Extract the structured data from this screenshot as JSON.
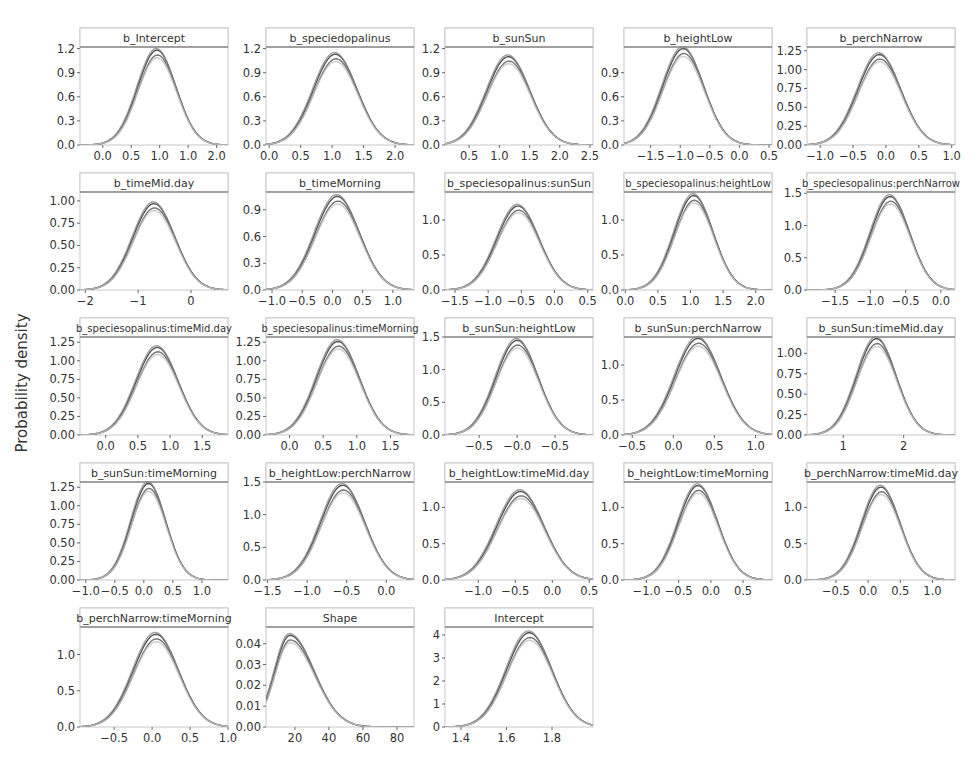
{
  "figure": {
    "ylabel": "Probability density",
    "colors": {
      "strip_fill": "#ffffff",
      "strip_border": "#8a8a8a",
      "panel_border": "#c8c8c8",
      "text": "#333333",
      "chains": [
        "#2a2a2a",
        "#555555",
        "#8a8a8a",
        "#c0c0c0"
      ]
    }
  },
  "chart_data": {
    "type": "line",
    "title": "",
    "xlabel": "",
    "ylabel": "Probability density",
    "grid": false,
    "legend": "none",
    "layout": {
      "rows": 5,
      "cols": 5
    },
    "panels": [
      {
        "title": "b_Intercept",
        "xlim": [
          -0.4,
          2.2
        ],
        "ylim": [
          0,
          1.22
        ],
        "xticks": [
          "0.0",
          "0.5",
          "1.0",
          "1.0",
          "2.0"
        ],
        "xtick_pos": [
          0.0,
          0.5,
          1.0,
          1.5,
          2.0
        ],
        "yticks": [
          "0.0",
          "0.3",
          "0.6",
          "0.9",
          "1.2"
        ],
        "ytick_pos": [
          0,
          0.3,
          0.6,
          0.9,
          1.2
        ],
        "mean": 0.95,
        "sd": 0.34,
        "peak": 1.18
      },
      {
        "title": "b_speciedopalinus",
        "xlim": [
          -0.05,
          2.3
        ],
        "ylim": [
          0,
          1.22
        ],
        "xticks": [
          "0.0",
          "0.5",
          "1.0",
          "1.5",
          "2.0"
        ],
        "xtick_pos": [
          0,
          0.5,
          1,
          1.5,
          2
        ],
        "yticks": [
          "0.0",
          "0.3",
          "0.6",
          "0.9",
          "1.2"
        ],
        "ytick_pos": [
          0,
          0.3,
          0.6,
          0.9,
          1.2
        ],
        "mean": 1.05,
        "sd": 0.35,
        "peak": 1.13
      },
      {
        "title": "b_sunSun",
        "xlim": [
          0.1,
          2.55
        ],
        "ylim": [
          0,
          1.22
        ],
        "xticks": [
          "0.5",
          "1.0",
          "1.5",
          "2.0",
          "2.5"
        ],
        "xtick_pos": [
          0.5,
          1,
          1.5,
          2,
          2.5
        ],
        "yticks": [
          "0.0",
          "0.3",
          "0.6",
          "0.9",
          "1.2"
        ],
        "ytick_pos": [
          0,
          0.3,
          0.6,
          0.9,
          1.2
        ],
        "mean": 1.15,
        "sd": 0.36,
        "peak": 1.1
      },
      {
        "title": "b_heightLow",
        "xlim": [
          -1.95,
          0.55
        ],
        "ylim": [
          0,
          1.22
        ],
        "xticks": [
          "-1.5",
          "-1.0",
          "-0.5",
          "0.0",
          "0.5"
        ],
        "xtick_pos": [
          -1.5,
          -1,
          -0.5,
          0,
          0.5
        ],
        "yticks": [
          "0.0",
          "0.3",
          "0.6",
          "0.9"
        ],
        "ytick_pos": [
          0,
          0.3,
          0.6,
          0.9
        ],
        "mean": -0.95,
        "sd": 0.35,
        "peak": 1.2
      },
      {
        "title": "b_perchNarrow",
        "xlim": [
          -1.2,
          1.05
        ],
        "ylim": [
          0,
          1.3
        ],
        "xticks": [
          "-1.0",
          "-0.5",
          "0.0",
          "0.5",
          "1.0"
        ],
        "xtick_pos": [
          -1,
          -0.5,
          0,
          0.5,
          1
        ],
        "yticks": [
          "0.00",
          "0.25",
          "0.50",
          "0.75",
          "1.00",
          "1.25"
        ],
        "ytick_pos": [
          0,
          0.25,
          0.5,
          0.75,
          1,
          1.25
        ],
        "mean": -0.1,
        "sd": 0.33,
        "peak": 1.2
      },
      {
        "title": "b_timeMid.day",
        "xlim": [
          -2.1,
          0.7
        ],
        "ylim": [
          0,
          1.1
        ],
        "xticks": [
          "-2",
          "-1",
          "0"
        ],
        "xtick_pos": [
          -2,
          -1,
          0
        ],
        "yticks": [
          "0.00",
          "0.25",
          "0.50",
          "0.75",
          "1.00"
        ],
        "ytick_pos": [
          0,
          0.25,
          0.5,
          0.75,
          1
        ],
        "mean": -0.7,
        "sd": 0.4,
        "peak": 0.97
      },
      {
        "title": "b_timeMorning",
        "xlim": [
          -1.1,
          1.35
        ],
        "ylim": [
          0,
          1.1
        ],
        "xticks": [
          "-1.0",
          "-0.5",
          "0.0",
          "0.5",
          "1.0"
        ],
        "xtick_pos": [
          -1,
          -0.5,
          0,
          0.5,
          1
        ],
        "yticks": [
          "0.0",
          "0.3",
          "0.6",
          "0.9"
        ],
        "ytick_pos": [
          0,
          0.3,
          0.6,
          0.9
        ],
        "mean": 0.08,
        "sd": 0.37,
        "peak": 1.05
      },
      {
        "title": "b_speciesopalinus:sunSun",
        "xlim": [
          -1.65,
          0.58
        ],
        "ylim": [
          0,
          1.4
        ],
        "xticks": [
          "-1.5",
          "-1.0",
          "-0.5",
          "0.0",
          "0.5"
        ],
        "xtick_pos": [
          -1.5,
          -1,
          -0.5,
          0,
          0.5
        ],
        "yticks": [
          "0.0",
          "0.5",
          "1.0"
        ],
        "ytick_pos": [
          0,
          0.5,
          1
        ],
        "mean": -0.55,
        "sd": 0.32,
        "peak": 1.2
      },
      {
        "title": "b_speciesopalinus:heightLow",
        "xlim": [
          -0.02,
          2.25
        ],
        "ylim": [
          0,
          1.4
        ],
        "xticks": [
          "0.0",
          "0.5",
          "1.0",
          "1.5",
          "2.0"
        ],
        "xtick_pos": [
          0,
          0.5,
          1,
          1.5,
          2
        ],
        "yticks": [
          "0.0",
          "0.5",
          "1.0"
        ],
        "ytick_pos": [
          0,
          0.5,
          1
        ],
        "mean": 1.05,
        "sd": 0.3,
        "peak": 1.35
      },
      {
        "title": "b_speciesopalinus:perchNarrow",
        "xlim": [
          -1.9,
          0.2
        ],
        "ylim": [
          0,
          1.52
        ],
        "xticks": [
          "-1.5",
          "-1.0",
          "-0.5",
          "0.0"
        ],
        "xtick_pos": [
          -1.5,
          -1,
          -0.5,
          0
        ],
        "yticks": [
          "0.0",
          "0.5",
          "1.0",
          "1.5"
        ],
        "ytick_pos": [
          0,
          0.5,
          1,
          1.5
        ],
        "mean": -0.72,
        "sd": 0.28,
        "peak": 1.45
      },
      {
        "title": "b_speciesopalinus:timeMid.day",
        "xlim": [
          -0.4,
          1.9
        ],
        "ylim": [
          0,
          1.32
        ],
        "xticks": [
          "0.0",
          "0.5",
          "1.0",
          "1.5"
        ],
        "xtick_pos": [
          0,
          0.5,
          1,
          1.5
        ],
        "yticks": [
          "0.00",
          "0.25",
          "0.50",
          "0.75",
          "1.00",
          "1.25"
        ],
        "ytick_pos": [
          0,
          0.25,
          0.5,
          0.75,
          1,
          1.25
        ],
        "mean": 0.8,
        "sd": 0.33,
        "peak": 1.18
      },
      {
        "title": "b_speciesopalinus:timeMorning",
        "xlim": [
          -0.35,
          1.85
        ],
        "ylim": [
          0,
          1.32
        ],
        "xticks": [
          "0.0",
          "0.5",
          "1.0",
          "1.5"
        ],
        "xtick_pos": [
          0,
          0.5,
          1,
          1.5
        ],
        "yticks": [
          "0.00",
          "0.25",
          "0.50",
          "0.75",
          "1.00",
          "1.25"
        ],
        "ytick_pos": [
          0,
          0.25,
          0.5,
          0.75,
          1,
          1.25
        ],
        "mean": 0.72,
        "sd": 0.32,
        "peak": 1.26
      },
      {
        "title": "b_sunSun:heightLow",
        "xlim": [
          -0.95,
          1.0
        ],
        "ylim": [
          0,
          1.5
        ],
        "xticks": [
          "-0.5",
          "-0.0",
          "-0.5"
        ],
        "xtick_pos": [
          -0.5,
          0,
          0.5
        ],
        "yticks": [
          "0.0",
          "0.5",
          "1.0",
          "1.5"
        ],
        "ytick_pos": [
          0,
          0.5,
          1,
          1.5
        ],
        "mean": 0.0,
        "sd": 0.28,
        "peak": 1.45
      },
      {
        "title": "b_sunSun:perchNarrow",
        "xlim": [
          -0.6,
          1.2
        ],
        "ylim": [
          0,
          1.4
        ],
        "xticks": [
          "-0.5",
          "0.0",
          "0.5",
          "1.0"
        ],
        "xtick_pos": [
          -0.5,
          0,
          0.5,
          1
        ],
        "yticks": [
          "0.0",
          "0.5",
          "1.0"
        ],
        "ytick_pos": [
          0,
          0.5,
          1
        ],
        "mean": 0.3,
        "sd": 0.28,
        "peak": 1.38
      },
      {
        "title": "b_sunSun:timeMid.day",
        "xlim": [
          0.4,
          2.85
        ],
        "ylim": [
          0,
          1.2
        ],
        "xticks": [
          "1",
          "2"
        ],
        "xtick_pos": [
          1,
          2
        ],
        "yticks": [
          "0.00",
          "0.25",
          "0.50",
          "0.75",
          "1.00"
        ],
        "ytick_pos": [
          0,
          0.25,
          0.5,
          0.75,
          1
        ],
        "mean": 1.55,
        "sd": 0.33,
        "peak": 1.18
      },
      {
        "title": "b_sunSun:timeMorning",
        "xlim": [
          -1.1,
          1.45
        ],
        "ylim": [
          0,
          1.32
        ],
        "xticks": [
          "-1.0",
          "-0.5",
          "0.0",
          "0.5",
          "1.0"
        ],
        "xtick_pos": [
          -1,
          -0.5,
          0,
          0.5,
          1
        ],
        "yticks": [
          "0.00",
          "0.25",
          "0.50",
          "0.75",
          "1.00",
          "1.25"
        ],
        "ytick_pos": [
          0,
          0.25,
          0.5,
          0.75,
          1,
          1.25
        ],
        "mean": 0.08,
        "sd": 0.3,
        "peak": 1.3
      },
      {
        "title": "b_heightLow:perchNarrow",
        "xlim": [
          -1.52,
          0.35
        ],
        "ylim": [
          0,
          1.5
        ],
        "xticks": [
          "-1.5",
          "-1.0",
          "-0.5",
          "0.0"
        ],
        "xtick_pos": [
          -1.5,
          -1,
          -0.5,
          0
        ],
        "yticks": [
          "0.0",
          "0.5",
          "1.0",
          "1.5"
        ],
        "ytick_pos": [
          0,
          0.5,
          1,
          1.5
        ],
        "mean": -0.55,
        "sd": 0.28,
        "peak": 1.45
      },
      {
        "title": "b_heightLow:timeMid.day",
        "xlim": [
          -1.45,
          0.55
        ],
        "ylim": [
          0,
          1.35
        ],
        "xticks": [
          "-1.0",
          "-0.5",
          "0.0",
          "0.5"
        ],
        "xtick_pos": [
          -1,
          -0.5,
          0,
          0.5
        ],
        "yticks": [
          "0.0",
          "0.5",
          "1.0"
        ],
        "ytick_pos": [
          0,
          0.5,
          1
        ],
        "mean": -0.43,
        "sd": 0.32,
        "peak": 1.22
      },
      {
        "title": "b_heightLow:timeMorning",
        "xlim": [
          -1.35,
          0.95
        ],
        "ylim": [
          0,
          1.35
        ],
        "xticks": [
          "-1.0",
          "-0.5",
          "0.0",
          "0.5"
        ],
        "xtick_pos": [
          -1,
          -0.5,
          0,
          0.5
        ],
        "yticks": [
          "0.0",
          "0.5",
          "1.0"
        ],
        "ytick_pos": [
          0,
          0.5,
          1
        ],
        "mean": -0.2,
        "sd": 0.31,
        "peak": 1.3
      },
      {
        "title": "b_perchNarrow:timeMid.day",
        "xlim": [
          -0.95,
          1.35
        ],
        "ylim": [
          0,
          1.35
        ],
        "xticks": [
          "-0.5",
          "0.0",
          "0.5",
          "1.0"
        ],
        "xtick_pos": [
          -0.5,
          0,
          0.5,
          1
        ],
        "yticks": [
          "0.0",
          "0.5",
          "1.0"
        ],
        "ytick_pos": [
          0,
          0.5,
          1
        ],
        "mean": 0.2,
        "sd": 0.3,
        "peak": 1.28
      },
      {
        "title": "b_perchNarrow:timeMorning",
        "xlim": [
          -0.95,
          1.0
        ],
        "ylim": [
          0,
          1.38
        ],
        "xticks": [
          "-0.5",
          "0.0",
          "0.5",
          "1.0"
        ],
        "xtick_pos": [
          -0.5,
          0,
          0.5,
          1
        ],
        "yticks": [
          "0.0",
          "0.5",
          "1.0"
        ],
        "ytick_pos": [
          0,
          0.5,
          1
        ],
        "mean": 0.05,
        "sd": 0.3,
        "peak": 1.28
      },
      {
        "title": "Shape",
        "xlim": [
          3,
          90
        ],
        "ylim": [
          0,
          0.048
        ],
        "xticks": [
          "20",
          "40",
          "60",
          "80"
        ],
        "xtick_pos": [
          20,
          40,
          60,
          80
        ],
        "yticks": [
          "0.00",
          "0.01",
          "0.02",
          "0.03",
          "0.04"
        ],
        "ytick_pos": [
          0,
          0.01,
          0.02,
          0.03,
          0.04
        ],
        "mean": 17,
        "sd": 9,
        "peak": 0.044,
        "skew": true
      },
      {
        "title": "Intercept",
        "xlim": [
          1.33,
          1.98
        ],
        "ylim": [
          0,
          4.35
        ],
        "xticks": [
          "1.4",
          "1.6",
          "1.8"
        ],
        "xtick_pos": [
          1.4,
          1.6,
          1.8
        ],
        "yticks": [
          "0",
          "1",
          "2",
          "3",
          "4"
        ],
        "ytick_pos": [
          0,
          1,
          2,
          3,
          4
        ],
        "mean": 1.7,
        "sd": 0.1,
        "peak": 4.1
      }
    ]
  }
}
